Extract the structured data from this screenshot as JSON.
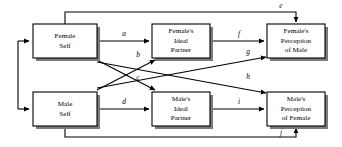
{
  "diagram": {
    "type": "path-diagram",
    "background_color": "#ffffff",
    "line_color": "#000000",
    "box_fill_color": "#ffffff",
    "shadow_color": "#7a7a7a",
    "nodes": [
      {
        "id": "female-self",
        "lines": [
          "Female",
          "Self"
        ],
        "line1": "Female",
        "line2": "Self",
        "line3": "",
        "x": 33,
        "y": 24,
        "w": 64,
        "h": 34
      },
      {
        "id": "female-ideal-partner",
        "lines": [
          "Female's",
          "Ideal",
          "Partner"
        ],
        "line1": "Female's",
        "line2": "Ideal",
        "line3": "Partner",
        "x": 152,
        "y": 24,
        "w": 58,
        "h": 34
      },
      {
        "id": "female-perception-of-male",
        "lines": [
          "Female's",
          "Perception",
          "of Male"
        ],
        "line1": "Female's",
        "line2": "Perception",
        "line3": "of Male",
        "x": 267,
        "y": 24,
        "w": 58,
        "h": 34
      },
      {
        "id": "male-self",
        "lines": [
          "Male",
          "Self"
        ],
        "line1": "Male",
        "line2": "Self",
        "line3": "",
        "x": 33,
        "y": 92,
        "w": 64,
        "h": 34
      },
      {
        "id": "male-ideal-partner",
        "lines": [
          "Male's",
          "Ideal",
          "Partner"
        ],
        "line1": "Male's",
        "line2": "Ideal",
        "line3": "Partner",
        "x": 152,
        "y": 92,
        "w": 58,
        "h": 34
      },
      {
        "id": "male-perception-of-female",
        "lines": [
          "Male's",
          "Perception",
          "of Female"
        ],
        "line1": "Male's",
        "line2": "Perception",
        "line3": "of Female",
        "x": 267,
        "y": 92,
        "w": 58,
        "h": 34
      }
    ],
    "edges": [
      {
        "id": "a",
        "label": "a",
        "from": "female-self",
        "to": "female-ideal-partner",
        "label_x": 124,
        "label_y": 34
      },
      {
        "id": "b",
        "label": "b",
        "from": "male-self",
        "to": "female-ideal-partner",
        "label_x": 138,
        "label_y": 56
      },
      {
        "id": "c",
        "label": "c",
        "from": "female-self",
        "to": "male-ideal-partner",
        "label_x": 138,
        "label_y": 79
      },
      {
        "id": "d",
        "label": "d",
        "from": "male-self",
        "to": "male-ideal-partner",
        "label_x": 124,
        "label_y": 102
      },
      {
        "id": "e",
        "label": "e",
        "from": "female-self",
        "to": "female-perception-of-male",
        "label_x": 281,
        "label_y": 11
      },
      {
        "id": "f",
        "label": "f",
        "from": "female-ideal-partner",
        "to": "female-perception-of-male",
        "label_x": 239,
        "label_y": 34
      },
      {
        "id": "g",
        "label": "g",
        "from": "male-self",
        "to": "female-perception-of-male",
        "label_x": 248,
        "label_y": 58
      },
      {
        "id": "h",
        "label": "h",
        "from": "female-self",
        "to": "male-perception-of-female",
        "label_x": 248,
        "label_y": 81
      },
      {
        "id": "i",
        "label": "i",
        "from": "male-ideal-partner",
        "to": "male-perception-of-female",
        "label_x": 239,
        "label_y": 102
      },
      {
        "id": "j",
        "label": "j",
        "from": "male-self",
        "to": "male-perception-of-female",
        "label_x": 281,
        "label_y": 136
      }
    ],
    "feedback": {
      "description": "left-side return lines into Female Self and Male Self",
      "vertical_x": 18
    }
  }
}
